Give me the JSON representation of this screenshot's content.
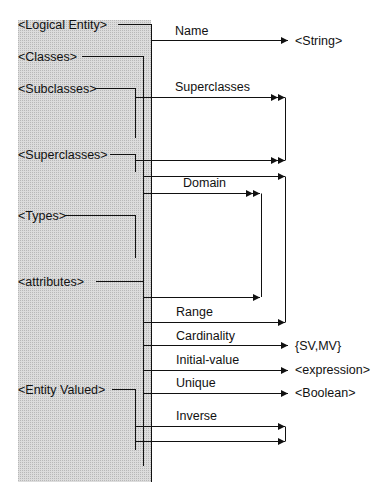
{
  "diagram": {
    "left_entities": [
      {
        "id": "logical-entity",
        "label": "<Logical Entity>"
      },
      {
        "id": "classes",
        "label": "<Classes>"
      },
      {
        "id": "subclasses",
        "label": "<Subclasses>"
      },
      {
        "id": "superclasses",
        "label": "<Superclasses>"
      },
      {
        "id": "types",
        "label": "<Types>"
      },
      {
        "id": "attributes",
        "label": "<attributes>"
      },
      {
        "id": "entity-valued",
        "label": "<Entity Valued>"
      }
    ],
    "relations": [
      {
        "id": "name",
        "label": "Name",
        "target": "<String>"
      },
      {
        "id": "superclasses",
        "label": "Superclasses"
      },
      {
        "id": "domain",
        "label": "Domain"
      },
      {
        "id": "range",
        "label": "Range"
      },
      {
        "id": "cardinality",
        "label": "Cardinality",
        "target": "{SV,MV}"
      },
      {
        "id": "initial-value",
        "label": "Initial-value",
        "target": "<expression>"
      },
      {
        "id": "unique",
        "label": "Unique",
        "target": "<Boolean>"
      },
      {
        "id": "inverse",
        "label": "Inverse"
      }
    ],
    "colors": {
      "panel": "#d4d4d4",
      "line": "#111111",
      "background": "#ffffff"
    }
  }
}
